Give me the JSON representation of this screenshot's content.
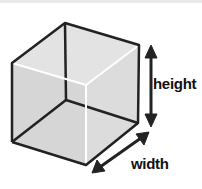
{
  "diagram": {
    "labels": {
      "height": "height",
      "width": "width"
    },
    "colors": {
      "face_fill": "#d9d9d9",
      "edge": "#222222",
      "hidden_edge_highlight": "#ffffff",
      "arrow": "#222222"
    }
  }
}
